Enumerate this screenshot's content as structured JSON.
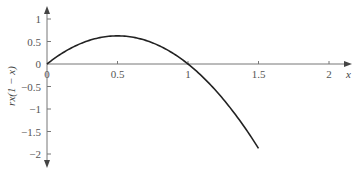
{
  "chart_data": {
    "type": "line",
    "title": "",
    "xlabel": "x",
    "ylabel": "rx(1 − x)",
    "xlim": [
      0,
      2.15
    ],
    "ylim": [
      -2.3,
      1.25
    ],
    "grid": false,
    "legend": null,
    "x_ticks": [
      {
        "value": 0,
        "label": "0"
      },
      {
        "value": 0.5,
        "label": "0.5"
      },
      {
        "value": 1,
        "label": "1"
      },
      {
        "value": 1.5,
        "label": "1.5"
      },
      {
        "value": 2,
        "label": "2"
      }
    ],
    "y_ticks": [
      {
        "value": 1,
        "label": "1"
      },
      {
        "value": 0.5,
        "label": "0.5"
      },
      {
        "value": 0,
        "label": "0"
      },
      {
        "value": -0.5,
        "label": "−0.5"
      },
      {
        "value": -1,
        "label": "−1"
      },
      {
        "value": -1.5,
        "label": "−1.5"
      },
      {
        "value": -2,
        "label": "−2"
      }
    ],
    "series": [
      {
        "name": "rx(1 − x), r = 2.5",
        "function": "2.5*x*(1-x)",
        "x": [
          0,
          0.1,
          0.2,
          0.3,
          0.4,
          0.5,
          0.6,
          0.7,
          0.8,
          0.9,
          1.0,
          1.1,
          1.2,
          1.3,
          1.4,
          1.5
        ],
        "y": [
          0,
          0.225,
          0.4,
          0.525,
          0.6,
          0.625,
          0.6,
          0.525,
          0.4,
          0.225,
          0,
          -0.275,
          -0.6,
          -0.975,
          -1.4,
          -1.875
        ]
      }
    ]
  },
  "layout": {
    "origin_px": [
      47,
      64
    ],
    "x_px_per_unit": 141,
    "y_px_per_unit": 45,
    "x_axis_end_px": 352,
    "y_axis_top_px": 6,
    "y_axis_bottom_px": 168,
    "line_color": "#222222",
    "axis_color": "#777777"
  }
}
